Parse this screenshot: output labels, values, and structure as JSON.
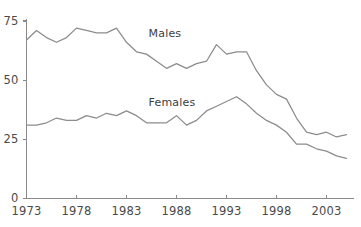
{
  "chart_data": {
    "type": "line",
    "title": "",
    "subtitle": "",
    "xlabel": "",
    "ylabel": "",
    "xlim": [
      1973,
      2005
    ],
    "ylim": [
      0,
      75
    ],
    "grid": false,
    "legend_position": "inline-annotation",
    "y_ticks": [
      0,
      25,
      50,
      75
    ],
    "y_tick_labels": [
      "0",
      "25",
      "50",
      "75"
    ],
    "x_ticks": [
      1973,
      1978,
      1983,
      1988,
      1993,
      1998,
      2003
    ],
    "x_tick_labels": [
      "1973",
      "1978",
      "1983",
      "1988",
      "1993",
      "1998",
      "2003"
    ],
    "x": [
      1973,
      1974,
      1975,
      1976,
      1977,
      1978,
      1979,
      1980,
      1981,
      1982,
      1983,
      1984,
      1985,
      1986,
      1987,
      1988,
      1989,
      1990,
      1991,
      1992,
      1993,
      1994,
      1995,
      1996,
      1997,
      1998,
      1999,
      2000,
      2001,
      2002,
      2003,
      2004,
      2005
    ],
    "series": [
      {
        "name": "Males",
        "color": "#8c8c8c",
        "label_x": 1985,
        "label_y": 69,
        "values": [
          67,
          71,
          68,
          66,
          68,
          72,
          71,
          70,
          70,
          72,
          66,
          62,
          61,
          58,
          55,
          57,
          55,
          57,
          58,
          65,
          61,
          62,
          62,
          54,
          48,
          44,
          42,
          34,
          28,
          27,
          28,
          26,
          27
        ]
      },
      {
        "name": "Females",
        "color": "#8c8c8c",
        "label_x": 1985,
        "label_y": 40,
        "values": [
          31,
          31,
          32,
          34,
          33,
          33,
          35,
          34,
          36,
          35,
          37,
          35,
          32,
          32,
          32,
          35,
          31,
          33,
          37,
          39,
          41,
          43,
          40,
          36,
          33,
          31,
          28,
          23,
          23,
          21,
          20,
          18,
          17
        ]
      }
    ],
    "annotations": [
      {
        "text": "Males",
        "x": 1985,
        "y": 69
      },
      {
        "text": "Females",
        "x": 1985,
        "y": 40
      }
    ]
  },
  "axis_colors": {
    "axis": "#8a8a8a",
    "text": "#4a4a4a",
    "line": "#8c8c8c"
  }
}
